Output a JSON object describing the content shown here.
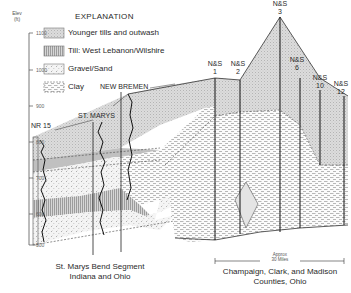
{
  "axis": {
    "title_line1": "Elev",
    "title_line2": "(ft)",
    "ticks": [
      "1100",
      "1000",
      "900",
      "800",
      "700",
      "600",
      "500"
    ]
  },
  "explanation": {
    "title": "EXPLANATION",
    "items": [
      {
        "label": "Younger tills and outwash",
        "pattern": "dotted-gray",
        "color": "#d8d8d8"
      },
      {
        "label": "Till: West Lebanon/Wilshire",
        "pattern": "vertical-lines",
        "color": "#c8c8c8"
      },
      {
        "label": "Gravel/Sand",
        "pattern": "stipple",
        "color": "#f2f2f2"
      },
      {
        "label": "Clay",
        "pattern": "dashes",
        "color": "#ffffff"
      }
    ]
  },
  "wells_west": [
    {
      "label": "NR 15"
    },
    {
      "label": "ST. MARYS"
    },
    {
      "label": "NEW BREMEN"
    }
  ],
  "wells_east": [
    {
      "label_line1": "N&S",
      "label_line2": "1"
    },
    {
      "label_line1": "N&S",
      "label_line2": "2"
    },
    {
      "label_line1": "N&S",
      "label_line2": "3"
    },
    {
      "label_line1": "N&S",
      "label_line2": "6"
    },
    {
      "label_line1": "N&S",
      "label_line2": "10"
    },
    {
      "label_line1": "N&S",
      "label_line2": "12"
    }
  ],
  "scale": {
    "line1": "Approx",
    "line2": "30 Miles"
  },
  "captions": {
    "west_line1": "St. Marys Bend Segment",
    "west_line2": "Indiana and Ohio",
    "east_line1": "Champaign, Clark, and Madison",
    "east_line2": "Counties, Ohio"
  }
}
